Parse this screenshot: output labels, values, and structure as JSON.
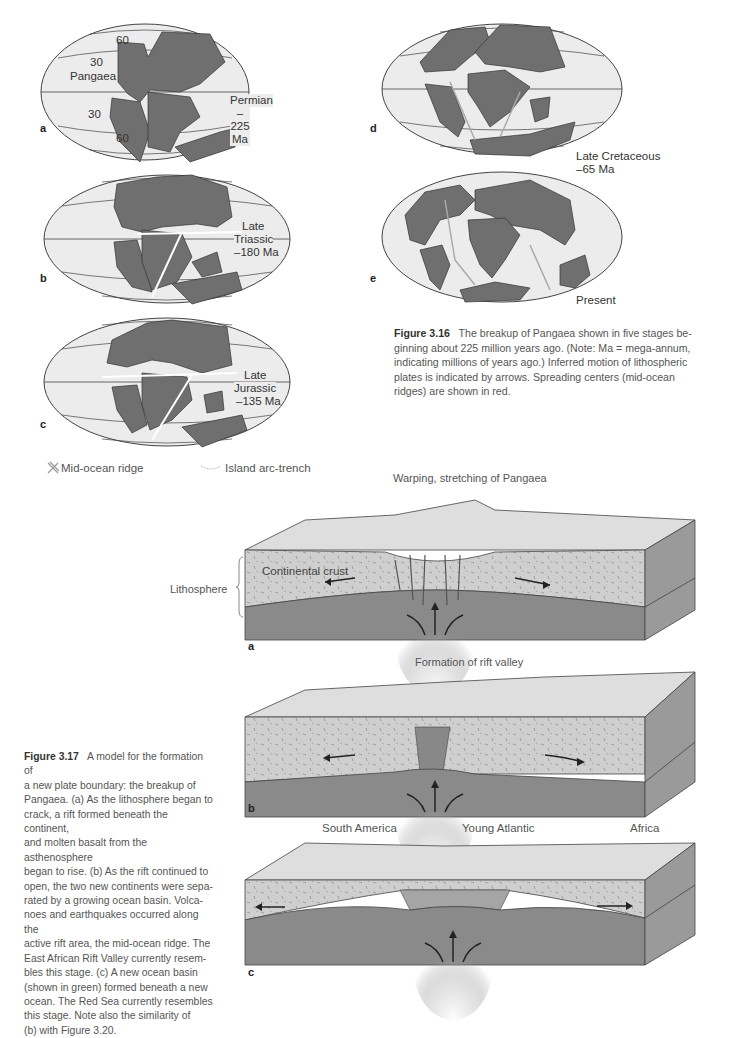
{
  "figure_3_16": {
    "maps": [
      {
        "letter": "a",
        "label_line1": "Permian",
        "label_line2": "–225 Ma",
        "lat_labels": [
          "60",
          "30",
          "30",
          "60"
        ],
        "region_label": "Pangaea"
      },
      {
        "letter": "b",
        "label_line1": "Late",
        "label_line2": "Triassic",
        "label_line3": "–180 Ma"
      },
      {
        "letter": "c",
        "label_line1": "Late",
        "label_line2": "Jurassic",
        "label_line3": "–135 Ma"
      },
      {
        "letter": "d",
        "label_line1": "Late Cretaceous",
        "label_line2": "–65 Ma"
      },
      {
        "letter": "e",
        "label_line1": "Present"
      }
    ],
    "legend": {
      "ridge_label": "Mid-ocean ridge",
      "trench_label": "Island arc-trench"
    },
    "caption": {
      "title": "Figure 3.16",
      "lines": [
        "The breakup of Pangaea shown in five stages be-",
        "ginning about 225 million years ago. (Note: Ma = mega-annum,",
        "indicating millions of years ago.) Inferred motion of lithospheric",
        "plates is indicated by arrows. Spreading centers (mid-ocean",
        "ridges) are shown in red."
      ]
    }
  },
  "figure_3_17": {
    "panels": [
      {
        "letter": "a",
        "title": "Warping, stretching of Pangaea",
        "crust_label": "Continental crust",
        "side_label": "Lithosphere"
      },
      {
        "letter": "b",
        "title": "Formation of rift valley"
      },
      {
        "letter": "c",
        "left_label": "South America",
        "center_label": "Young Atlantic",
        "right_label": "Africa"
      }
    ],
    "caption": {
      "title": "Figure 3.17",
      "lines": [
        "A model for the formation of",
        "a new plate boundary: the breakup of",
        "Pangaea. (a) As the lithosphere began to",
        "crack, a rift formed beneath the continent,",
        "and molten basalt from the asthenosphere",
        "began to rise. (b) As the rift continued to",
        "open, the two new continents were sepa-",
        "rated by a growing ocean basin. Volca-",
        "noes and earthquakes occurred along the",
        "active rift area, the mid-ocean ridge. The",
        "East African Rift Valley currently resem-",
        "bles this stage. (c) A new ocean basin",
        "(shown in green) formed beneath a new",
        "ocean. The Red Sea currently resembles",
        "this stage. Note also the similarity of",
        "(b) with Figure 3.20."
      ]
    }
  },
  "colors": {
    "ocean": "#ebebeb",
    "land": "#6f6f6f",
    "crust": "#cfcfcf",
    "mantle": "#8a8a8a",
    "side": "#9a9a9a"
  }
}
